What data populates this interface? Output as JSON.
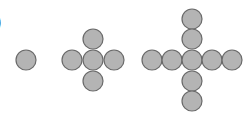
{
  "label_fragment": ")",
  "style": {
    "circle_fill": "#b4b4b4",
    "circle_stroke": "#6a6a6a",
    "circle_radius": 10
  },
  "figures": [
    {
      "name": "stage-1",
      "count": 1,
      "circles": [
        {
          "cx": 26,
          "cy": 60
        }
      ]
    },
    {
      "name": "stage-2",
      "count": 5,
      "circles": [
        {
          "cx": 93,
          "cy": 39
        },
        {
          "cx": 72,
          "cy": 60
        },
        {
          "cx": 93,
          "cy": 60
        },
        {
          "cx": 114,
          "cy": 60
        },
        {
          "cx": 93,
          "cy": 81
        }
      ]
    },
    {
      "name": "stage-3",
      "count": 9,
      "circles": [
        {
          "cx": 192,
          "cy": 19
        },
        {
          "cx": 192,
          "cy": 39
        },
        {
          "cx": 152,
          "cy": 60
        },
        {
          "cx": 172,
          "cy": 60
        },
        {
          "cx": 192,
          "cy": 60
        },
        {
          "cx": 212,
          "cy": 60
        },
        {
          "cx": 232,
          "cy": 60
        },
        {
          "cx": 192,
          "cy": 81
        },
        {
          "cx": 192,
          "cy": 101
        }
      ]
    }
  ]
}
